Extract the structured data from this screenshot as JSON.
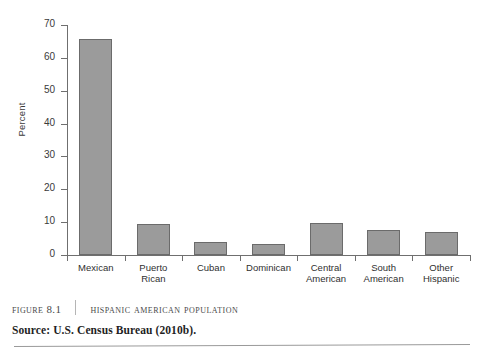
{
  "chart_data": {
    "type": "bar",
    "title": "Hispanic American Population",
    "xlabel": "",
    "ylabel": "Percent",
    "ylim": [
      0,
      70
    ],
    "yticks": [
      0,
      10,
      20,
      30,
      40,
      50,
      60,
      70
    ],
    "grid": false,
    "legend": "none",
    "bar_color": "#9b9b9b",
    "bar_edge_color": "#6b6b6b",
    "categories": [
      "Mexican",
      "Puerto\nRican",
      "Cuban",
      "Dominican",
      "Central\nAmerican",
      "South\nAmerican",
      "Other\nHispanic"
    ],
    "values": [
      65.7,
      9.4,
      4.0,
      3.4,
      9.7,
      7.5,
      6.9
    ]
  },
  "caption": {
    "figure_number": "Figure 8.1",
    "title": "Hispanic American Population"
  },
  "source": {
    "text": "Source: U.S. Census Bureau (2010b)."
  }
}
